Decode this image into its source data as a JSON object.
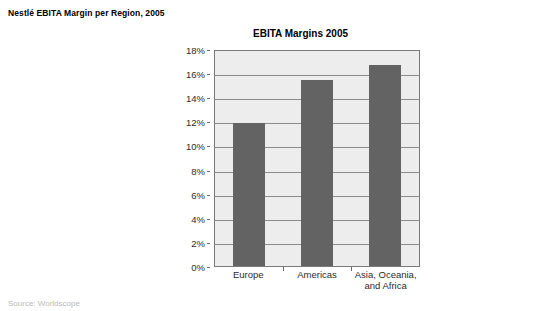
{
  "figure": {
    "caption": "Nestlé EBITA Margin per Region, 2005",
    "source": "Source: Worldscope"
  },
  "chart_data": {
    "type": "bar",
    "title": "EBITA Margins 2005",
    "xlabel": "",
    "ylabel": "",
    "categories": [
      "Europe",
      "Americas",
      "Asia, Oceania, and Africa"
    ],
    "category_lines": [
      [
        "Europe"
      ],
      [
        "Americas"
      ],
      [
        "Asia, Oceania,",
        "and Africa"
      ]
    ],
    "values": [
      11.9,
      15.4,
      16.7
    ],
    "value_labels": [
      "11.9%",
      "15.4%",
      "16.7%"
    ],
    "ylim": [
      0,
      18
    ],
    "ytick_values": [
      18,
      16,
      14,
      12,
      10,
      8,
      6,
      4,
      2,
      0
    ],
    "ytick_labels": [
      "18%",
      "16%",
      "14%",
      "12%",
      "10%",
      "8%",
      "6%",
      "4%",
      "2%",
      "0%"
    ],
    "grid": true,
    "legend": null,
    "colors": {
      "bar": "#636363",
      "plot_background": "#ededed",
      "gridline": "#8c8c8c",
      "frame": "#7a7a7a",
      "page_background": "#ffffff",
      "text": "#000000",
      "source_text": "#b9b9b9"
    }
  }
}
